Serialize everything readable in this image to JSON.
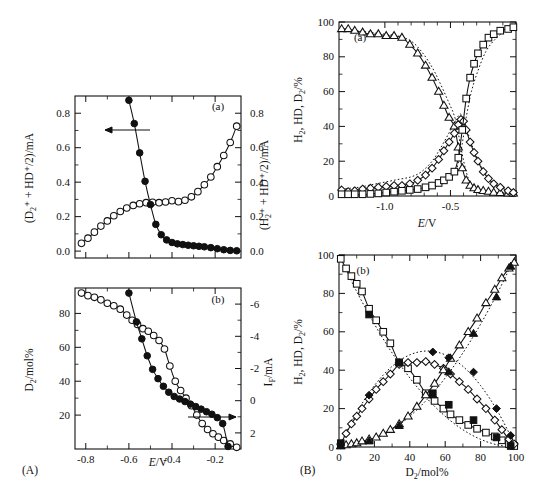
{
  "figure": {
    "header_artifact": "",
    "panel_A_label": "(A)",
    "panel_B_label": "(B)"
  },
  "panels": {
    "Aa": {
      "tag": "(a)",
      "ylabel_left": "(D₂⁺ + HD⁺/2)/mA",
      "ylabel_right": "(H₂⁺ + HD⁺/2)/mA",
      "yticks_left": [
        "0.0",
        "0.2",
        "0.4",
        "0.6",
        "0.8"
      ],
      "yticks_right": [
        "0.0",
        "0.2",
        "0.4",
        "0.6",
        "0.8"
      ],
      "arrow_direction": "left"
    },
    "Ab": {
      "tag": "(b)",
      "ylabel_left": "D₂/mol%",
      "ylabel_right": "Iᵩ/mA",
      "yticks_left": [
        "20",
        "40",
        "60",
        "80"
      ],
      "yticks_right": [
        "-6",
        "-4",
        "-2",
        "0",
        "2"
      ],
      "xlabel": "E/V",
      "xticks": [
        "-0.8",
        "-0.6",
        "-0.4",
        "-0.2"
      ],
      "arrow_direction": "right"
    },
    "Ba": {
      "tag": "(a)",
      "ylabel": "H₂, HD, D₂/%",
      "yticks": [
        "0",
        "20",
        "40",
        "60",
        "80",
        "100"
      ],
      "xlabel": "E/V",
      "xticks": [
        "-1.0",
        "-0.5"
      ]
    },
    "Bb": {
      "tag": "(b)",
      "ylabel": "H₂, HD, D₂/%",
      "yticks": [
        "0",
        "20",
        "40",
        "60",
        "80",
        "100"
      ],
      "xlabel": "D₂/mol%",
      "xticks": [
        "0",
        "20",
        "40",
        "60",
        "80",
        "100"
      ]
    }
  },
  "chart_data": [
    {
      "id": "Aa",
      "type": "line",
      "title": "(a)",
      "xlabel": "E/V",
      "ylabel": "(D₂⁺ + HD⁺/2)/mA",
      "ylabel_right": "(H₂⁺ + HD⁺/2)/mA",
      "xlim": [
        -0.85,
        -0.08
      ],
      "ylim": [
        -0.04,
        0.9
      ],
      "ylim_right": [
        -0.04,
        0.9
      ],
      "grid": false,
      "legend": "none",
      "series": [
        {
          "name": "(D2+ + HD+/2) filled circles, left axis",
          "marker": "filled-circle",
          "axis": "left",
          "x": [
            -0.6,
            -0.575,
            -0.55,
            -0.525,
            -0.5,
            -0.475,
            -0.45,
            -0.425,
            -0.4,
            -0.375,
            -0.35,
            -0.325,
            -0.3,
            -0.275,
            -0.25,
            -0.22,
            -0.19,
            -0.16,
            -0.13,
            -0.1
          ],
          "y": [
            0.875,
            0.74,
            0.57,
            0.405,
            0.27,
            0.155,
            0.095,
            0.065,
            0.05,
            0.042,
            0.038,
            0.034,
            0.031,
            0.028,
            0.025,
            0.02,
            0.014,
            0.008,
            0.004,
            0.002
          ]
        },
        {
          "name": "(H2+ + HD+/2) open circles, right axis",
          "marker": "open-circle",
          "axis": "right",
          "x": [
            -0.82,
            -0.79,
            -0.76,
            -0.73,
            -0.7,
            -0.67,
            -0.64,
            -0.61,
            -0.58,
            -0.55,
            -0.52,
            -0.49,
            -0.46,
            -0.43,
            -0.4,
            -0.37,
            -0.34,
            -0.31,
            -0.28,
            -0.25,
            -0.22,
            -0.19,
            -0.16,
            -0.13,
            -0.1
          ],
          "y": [
            0.045,
            0.075,
            0.11,
            0.145,
            0.175,
            0.205,
            0.23,
            0.25,
            0.265,
            0.275,
            0.281,
            0.283,
            0.281,
            0.285,
            0.292,
            0.287,
            0.295,
            0.315,
            0.345,
            0.385,
            0.43,
            0.49,
            0.555,
            0.63,
            0.725
          ]
        }
      ]
    },
    {
      "id": "Ab",
      "type": "line",
      "title": "(b)",
      "xlabel": "E/V",
      "ylabel": "D₂/mol%",
      "ylabel_right": "Iᵩ/mA",
      "xlim": [
        -0.85,
        -0.08
      ],
      "ylim": [
        0,
        95
      ],
      "ylim_right": [
        3,
        -7
      ],
      "grid": false,
      "legend": "none",
      "series": [
        {
          "name": "D2/mol% filled circles (left axis)",
          "marker": "filled-circle",
          "axis": "left",
          "x": [
            -0.6,
            -0.565,
            -0.54,
            -0.515,
            -0.49,
            -0.465,
            -0.44,
            -0.415,
            -0.39,
            -0.365,
            -0.34,
            -0.315,
            -0.29,
            -0.265,
            -0.24,
            -0.215,
            -0.19,
            -0.165,
            -0.14
          ],
          "y": [
            92.0,
            75.0,
            65.0,
            55.0,
            47.0,
            41.5,
            37.0,
            33.5,
            31.0,
            29.5,
            28.0,
            26.5,
            25.0,
            23.5,
            22.0,
            20.5,
            18.5,
            15.0,
            1.5
          ]
        },
        {
          "name": "I_F open circles (right axis)",
          "marker": "open-circle",
          "axis": "left",
          "x": [
            -0.82,
            -0.79,
            -0.76,
            -0.73,
            -0.7,
            -0.67,
            -0.64,
            -0.61,
            -0.585,
            -0.56,
            -0.535,
            -0.51,
            -0.485,
            -0.46,
            -0.435,
            -0.41,
            -0.385,
            -0.36,
            -0.335,
            -0.31,
            -0.285,
            -0.26,
            -0.235,
            -0.21,
            -0.185,
            -0.16,
            -0.13,
            -0.1
          ],
          "y": [
            92.0,
            90.5,
            89.5,
            88.0,
            86.0,
            84.5,
            82.5,
            79.0,
            76.0,
            73.5,
            71.0,
            69.5,
            67.0,
            64.0,
            59.0,
            49.0,
            40.0,
            34.5,
            30.0,
            25.5,
            20.0,
            15.0,
            11.5,
            9.0,
            7.0,
            5.0,
            3.0,
            1.0
          ]
        }
      ]
    },
    {
      "id": "Ba",
      "type": "line",
      "title": "(a)",
      "xlabel": "E/V",
      "ylabel": "H₂, HD, D₂/%",
      "xlim": [
        -1.35,
        0.0
      ],
      "ylim": [
        0,
        100
      ],
      "grid": false,
      "legend": "none",
      "series": [
        {
          "name": "D2 open triangles",
          "marker": "open-triangle",
          "x": [
            -1.33,
            -1.28,
            -1.23,
            -1.17,
            -1.11,
            -1.05,
            -0.99,
            -0.93,
            -0.87,
            -0.81,
            -0.75,
            -0.69,
            -0.64,
            -0.59,
            -0.55,
            -0.51,
            -0.47,
            -0.44,
            -0.41,
            -0.38,
            -0.35,
            -0.32,
            -0.29,
            -0.25,
            -0.21,
            -0.17,
            -0.12,
            -0.06,
            -0.02
          ],
          "y": [
            96,
            96,
            95,
            94,
            93,
            93,
            92,
            92,
            91,
            87,
            82,
            75,
            68,
            60,
            52,
            45,
            40,
            28,
            16,
            9,
            6,
            4.5,
            3.5,
            3,
            2.5,
            2,
            1.8,
            1.5,
            1.5
          ]
        },
        {
          "name": "HD open diamonds",
          "marker": "open-diamond",
          "x": [
            -1.33,
            -1.28,
            -1.23,
            -1.17,
            -1.11,
            -1.05,
            -0.99,
            -0.93,
            -0.87,
            -0.81,
            -0.75,
            -0.69,
            -0.64,
            -0.59,
            -0.55,
            -0.51,
            -0.47,
            -0.44,
            -0.42,
            -0.4,
            -0.38,
            -0.35,
            -0.32,
            -0.29,
            -0.25,
            -0.21,
            -0.17,
            -0.12,
            -0.06,
            -0.02
          ],
          "y": [
            3.5,
            2.5,
            3.0,
            4.0,
            4.5,
            5.0,
            5.5,
            6.0,
            6.0,
            7.0,
            9.0,
            12.0,
            16.0,
            21.0,
            26.0,
            31.0,
            36.0,
            41.0,
            44.0,
            43.0,
            38.0,
            31.0,
            25.0,
            20.0,
            14.0,
            10.0,
            7.0,
            5.0,
            3.0,
            2.0
          ]
        },
        {
          "name": "H2 open squares",
          "marker": "open-square",
          "x": [
            -1.33,
            -1.28,
            -1.23,
            -1.17,
            -1.11,
            -1.05,
            -0.99,
            -0.93,
            -0.87,
            -0.81,
            -0.75,
            -0.69,
            -0.64,
            -0.59,
            -0.55,
            -0.51,
            -0.47,
            -0.44,
            -0.41,
            -0.38,
            -0.35,
            -0.32,
            -0.29,
            -0.25,
            -0.21,
            -0.17,
            -0.12,
            -0.06,
            -0.02
          ],
          "y": [
            1.0,
            1.0,
            1.0,
            1.0,
            1.2,
            1.5,
            2.0,
            2.5,
            3.0,
            3.5,
            4.0,
            5.0,
            6.0,
            7.5,
            9.0,
            11.0,
            14.0,
            22.0,
            38.0,
            56.0,
            68.0,
            76.0,
            82.0,
            87.0,
            91.0,
            93.0,
            95.0,
            96.0,
            97.0
          ]
        },
        {
          "name": "D2 theory dotted",
          "marker": "none",
          "style": "dotted",
          "x": [
            -1.33,
            -1.2,
            -1.1,
            -1.0,
            -0.9,
            -0.8,
            -0.72,
            -0.64,
            -0.58,
            -0.52,
            -0.47,
            -0.44,
            -0.41,
            -0.38,
            -0.35,
            -0.3,
            -0.25,
            -0.18,
            -0.1,
            -0.02
          ],
          "y": [
            96,
            95,
            94,
            93,
            92,
            89,
            83,
            74,
            65,
            55,
            46,
            36,
            24,
            14,
            8,
            4,
            2.5,
            2,
            1.5,
            1.2
          ]
        },
        {
          "name": "HD theory dotted",
          "marker": "none",
          "style": "dotted",
          "x": [
            -1.33,
            -1.2,
            -1.1,
            -1.0,
            -0.9,
            -0.8,
            -0.72,
            -0.64,
            -0.58,
            -0.52,
            -0.47,
            -0.44,
            -0.42,
            -0.4,
            -0.37,
            -0.33,
            -0.28,
            -0.22,
            -0.14,
            -0.06,
            -0.02
          ],
          "y": [
            4.0,
            5.0,
            6.5,
            8.0,
            9.5,
            11.0,
            14.0,
            20.0,
            27.0,
            35.0,
            42.0,
            46.0,
            47.0,
            44.0,
            37.0,
            28.0,
            19.0,
            12.0,
            7.0,
            4.0,
            3.0
          ]
        },
        {
          "name": "H2 theory dotted",
          "marker": "none",
          "style": "dotted",
          "x": [
            -1.33,
            -1.2,
            -1.1,
            -1.0,
            -0.9,
            -0.8,
            -0.72,
            -0.64,
            -0.58,
            -0.52,
            -0.47,
            -0.44,
            -0.41,
            -0.38,
            -0.34,
            -0.29,
            -0.23,
            -0.16,
            -0.08,
            -0.02
          ],
          "y": [
            0.5,
            0.6,
            0.8,
            1.0,
            1.5,
            2.0,
            3.0,
            4.5,
            6.5,
            9.0,
            13.0,
            19.0,
            30.0,
            45.0,
            60.0,
            72.0,
            83.0,
            90.0,
            95.0,
            96.5
          ]
        }
      ]
    },
    {
      "id": "Bb",
      "type": "line",
      "title": "(b)",
      "xlabel": "D₂/mol%",
      "ylabel": "H₂, HD, D₂/%",
      "xlim": [
        0,
        100
      ],
      "ylim": [
        0,
        100
      ],
      "grid": false,
      "legend": "none",
      "series": [
        {
          "name": "H2 open squares",
          "marker": "open-square",
          "x": [
            1,
            4,
            7,
            10,
            13,
            17,
            21,
            25,
            29,
            34,
            39,
            44,
            49,
            54,
            59,
            63,
            68,
            73,
            78,
            83,
            88,
            92,
            96,
            99
          ],
          "y": [
            98,
            93,
            89,
            85,
            81,
            72,
            66,
            60,
            54,
            44,
            41,
            35,
            28,
            24,
            20,
            17,
            14,
            11.5,
            9.5,
            7.5,
            5.5,
            3.5,
            1.5,
            0.5
          ]
        },
        {
          "name": "HD open diamonds",
          "marker": "open-diamond",
          "x": [
            1,
            4,
            7,
            10,
            13,
            17,
            21,
            25,
            29,
            34,
            39,
            44,
            49,
            54,
            59,
            63,
            68,
            73,
            78,
            83,
            88,
            92,
            96,
            99
          ],
          "y": [
            1.5,
            7,
            12,
            16,
            20,
            25,
            30,
            34,
            38,
            43,
            44,
            44,
            44.5,
            43,
            41,
            38,
            34,
            30,
            25,
            20,
            14,
            9,
            4,
            1.5
          ]
        },
        {
          "name": "D2 open triangles",
          "marker": "open-triangle",
          "x": [
            1,
            4,
            7,
            10,
            13,
            17,
            21,
            25,
            29,
            34,
            39,
            44,
            49,
            54,
            59,
            63,
            68,
            73,
            78,
            83,
            88,
            92,
            96,
            99
          ],
          "y": [
            0.5,
            1,
            1.5,
            2,
            3,
            4,
            5,
            7,
            9,
            12,
            16,
            21,
            27,
            33,
            40,
            46,
            53,
            60,
            67,
            75,
            82,
            88,
            93,
            96
          ]
        },
        {
          "name": "H2 filled squares",
          "marker": "filled-square",
          "x": [
            1,
            17,
            34,
            53,
            62,
            76,
            89,
            97
          ],
          "y": [
            2,
            69,
            44,
            28,
            22,
            14,
            5,
            0.5
          ]
        },
        {
          "name": "HD filled diamonds",
          "marker": "filled-diamond",
          "x": [
            1,
            17,
            34,
            53,
            62,
            76,
            89,
            97
          ],
          "y": [
            1,
            27,
            44,
            49.5,
            46.5,
            39,
            20,
            6
          ]
        },
        {
          "name": "D2 filled triangles",
          "marker": "filled-triangle",
          "x": [
            1,
            17,
            34,
            53,
            62,
            76,
            89,
            97
          ],
          "y": [
            0.5,
            3,
            11,
            27,
            39,
            59,
            78,
            94
          ]
        },
        {
          "name": "H2 theory dotted",
          "marker": "none",
          "style": "dotted",
          "x": [
            0,
            10,
            20,
            30,
            40,
            50,
            60,
            70,
            80,
            90,
            100
          ],
          "y": [
            100,
            81,
            64,
            49,
            36,
            25,
            16,
            9,
            4,
            1,
            0
          ]
        },
        {
          "name": "HD theory dotted",
          "marker": "none",
          "style": "dotted",
          "x": [
            0,
            10,
            20,
            30,
            40,
            50,
            60,
            70,
            80,
            90,
            100
          ],
          "y": [
            0,
            18,
            32,
            42,
            48,
            50,
            48,
            42,
            32,
            18,
            0
          ]
        },
        {
          "name": "D2 theory dotted",
          "marker": "none",
          "style": "dotted",
          "x": [
            0,
            10,
            20,
            30,
            40,
            50,
            60,
            70,
            80,
            90,
            100
          ],
          "y": [
            0,
            1,
            4,
            9,
            16,
            25,
            36,
            49,
            64,
            81,
            100
          ]
        }
      ]
    }
  ]
}
